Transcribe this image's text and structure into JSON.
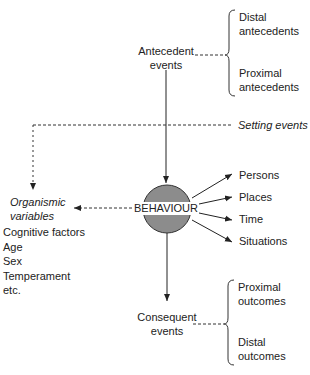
{
  "diagram": {
    "center": {
      "label": "BEHAVIOUR",
      "fill": "#8c8c8c"
    },
    "antecedent": {
      "label_line1": "Antecedent",
      "label_line2": "events",
      "branches": [
        {
          "line1": "Distal",
          "line2": "antecedents"
        },
        {
          "line1": "Proximal",
          "line2": "antecedents"
        }
      ]
    },
    "setting_events": {
      "label": "Setting events"
    },
    "organismic": {
      "title_line1": "Organismic",
      "title_line2": "variables",
      "items": [
        "Cognitive factors",
        "Age",
        "Sex",
        "Temperament",
        "etc."
      ]
    },
    "contexts": [
      "Persons",
      "Places",
      "Time",
      "Situations"
    ],
    "consequent": {
      "label_line1": "Consequent",
      "label_line2": "events",
      "branches": [
        {
          "line1": "Proximal",
          "line2": "outcomes"
        },
        {
          "line1": "Distal",
          "line2": "outcomes"
        }
      ]
    }
  }
}
